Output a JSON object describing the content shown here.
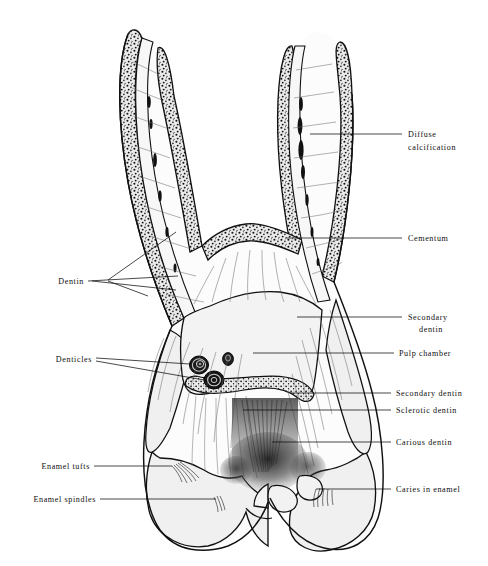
{
  "figure": {
    "background_color": "#ffffff",
    "ink_color": "#111111",
    "enamel_fill": "#f1f1f1",
    "dentin_fill": "#fbfbfb",
    "cementum_fill": "#e8e8e8",
    "pulp_fill": "#f4f4f4"
  },
  "labels": {
    "right": [
      {
        "id": "diffuse-calcification",
        "line1": "Diffuse",
        "line2": "calcification",
        "text_x": 408,
        "text_y": 134,
        "leader_x1": 310,
        "leader_y1": 134,
        "leader_x2": 402,
        "leader_y2": 134
      },
      {
        "id": "cementum",
        "line1": "Cementum",
        "line2": "",
        "text_x": 408,
        "text_y": 238,
        "leader_x1": 286,
        "leader_y1": 238,
        "leader_x2": 402,
        "leader_y2": 238
      },
      {
        "id": "secondary-dentin-upper",
        "line1": "Secondary",
        "line2": "dentin",
        "text_x": 408,
        "text_y": 317,
        "leader_x1": 297,
        "leader_y1": 317,
        "leader_x2": 402,
        "leader_y2": 317
      },
      {
        "id": "pulp-chamber",
        "line1": "Pulp chamber",
        "line2": "",
        "text_x": 399,
        "text_y": 353,
        "leader_x1": 253,
        "leader_y1": 353,
        "leader_x2": 394,
        "leader_y2": 353
      },
      {
        "id": "secondary-dentin-lower",
        "line1": "Secondary dentin",
        "line2": "",
        "text_x": 396,
        "text_y": 393,
        "leader_x1": 290,
        "leader_y1": 393,
        "leader_x2": 391,
        "leader_y2": 393
      },
      {
        "id": "sclerotic-dentin",
        "line1": "Sclerotic dentin",
        "line2": "",
        "text_x": 396,
        "text_y": 410,
        "leader_x1": 243,
        "leader_y1": 410,
        "leader_x2": 391,
        "leader_y2": 410
      },
      {
        "id": "carious-dentin",
        "line1": "Carious dentin",
        "line2": "",
        "text_x": 396,
        "text_y": 442,
        "leader_x1": 272,
        "leader_y1": 442,
        "leader_x2": 391,
        "leader_y2": 442
      },
      {
        "id": "caries-in-enamel",
        "line1": "Caries in enamel",
        "line2": "",
        "text_x": 396,
        "text_y": 489,
        "leader_x1": 316,
        "leader_y1": 489,
        "leader_x2": 391,
        "leader_y2": 489
      }
    ],
    "left": [
      {
        "id": "dentin",
        "line1": "Dentin",
        "line2": "",
        "text_x": 82,
        "text_y": 284,
        "leader_x1": 88,
        "leader_y1": 281,
        "leader_x2": 176,
        "leader_y2": 281
      },
      {
        "id": "denticles",
        "line1": "Denticles",
        "line2": "",
        "text_x": 90,
        "text_y": 362,
        "leader_x1": 96,
        "leader_y1": 359,
        "leader_x2": 196,
        "leader_y2": 359
      },
      {
        "id": "enamel-tufts",
        "line1": "Enamel tufts",
        "line2": "",
        "text_x": 88,
        "text_y": 468,
        "leader_x1": 94,
        "leader_y1": 466,
        "leader_x2": 172,
        "leader_y2": 466
      },
      {
        "id": "enamel-spindles",
        "line1": "Enamel spindles",
        "line2": "",
        "text_x": 94,
        "text_y": 501,
        "leader_x1": 100,
        "leader_y1": 499,
        "leader_x2": 216,
        "leader_y2": 499
      }
    ]
  },
  "structures": {
    "roots": [
      {
        "id": "root-mesial",
        "label": "mesial root"
      },
      {
        "id": "root-distal",
        "label": "distal root"
      }
    ],
    "denticles": [
      {
        "id": "denticle-large-left",
        "cx": 199,
        "cy": 365,
        "rx": 9.5,
        "ry": 9.0
      },
      {
        "id": "denticle-small-mid",
        "cx": 228,
        "cy": 359,
        "rx": 5.5,
        "ry": 6.5
      },
      {
        "id": "denticle-large-lower",
        "cx": 214,
        "cy": 380,
        "rx": 10.0,
        "ry": 9.0
      }
    ]
  }
}
